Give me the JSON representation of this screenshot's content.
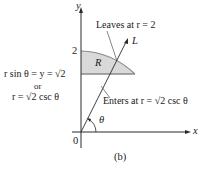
{
  "figure": {
    "caption": "(b)",
    "axes": {
      "x_label": "x",
      "y_label": "y",
      "origin_label": "0",
      "y_tick_2": "2"
    },
    "region_label": "R",
    "ray_label": "L",
    "angle_label": "θ",
    "annotations": {
      "leaves": "Leaves at r = 2",
      "enters": "Enters at r = √2 csc θ",
      "line_eq_1": "r sin θ = y = √2",
      "line_eq_or": "or",
      "line_eq_2": "r = √2 csc θ"
    },
    "colors": {
      "region_fill": "#d9d9d9",
      "region_stroke": "#8a8a8a",
      "line": "#2a2a2a",
      "text": "#1a1a1a"
    }
  }
}
